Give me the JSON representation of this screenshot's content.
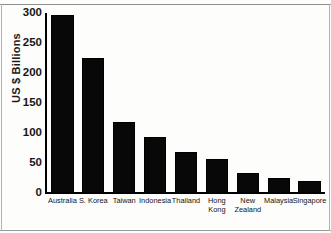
{
  "chart_data": {
    "type": "bar",
    "title": "",
    "subtitle": "",
    "xlabel": "",
    "ylabel": "US $ Billions",
    "categories": [
      "Australia",
      "S. Korea",
      "Taiwan",
      "Indonesia",
      "Thailand",
      "Hong\nKong",
      "New\nZealand",
      "Malaysia",
      "Singapore"
    ],
    "values": [
      297,
      225,
      118,
      94,
      68,
      57,
      33,
      25,
      20
    ],
    "ylim": [
      0,
      300
    ],
    "yticks": [
      0,
      50,
      100,
      150,
      200,
      250,
      300
    ],
    "ytick_labels": [
      "0",
      "50",
      "100",
      "150",
      "200",
      "250",
      "300"
    ],
    "grid": false,
    "legend": null,
    "legend_position": "none",
    "bar_color": "#080808",
    "axis_color": "#000000",
    "background_color": "#fdfdfc"
  }
}
